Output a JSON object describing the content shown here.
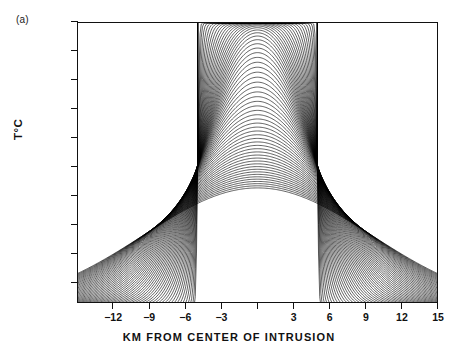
{
  "figure": {
    "panel_letter": "(a)",
    "width": 458,
    "height": 356
  },
  "axes": {
    "x_title": "KM FROM CENTER OF INTRUSION",
    "y_title": "T°C"
  },
  "chart_data": {
    "type": "line",
    "title": "",
    "subtitle": "",
    "xlabel": "KM FROM CENTER OF INTRUSION",
    "ylabel": "T°C",
    "xlim": [
      -15,
      15
    ],
    "ylim": [
      527,
      1375
    ],
    "grid": false,
    "legend": null,
    "annotations": [
      "(a)"
    ],
    "xticks": [
      -12,
      -9,
      -6,
      -3,
      0,
      3,
      6,
      9,
      12,
      15
    ],
    "xticklabels": [
      "-12",
      "-9",
      "-6",
      "-3",
      "",
      "3",
      "6",
      "9",
      "12",
      "15"
    ],
    "yticks": [
      587.5,
      675,
      762.5,
      850,
      937.5,
      1025,
      1112.5,
      1200,
      1287.5,
      1375
    ],
    "yticklabels": [
      "587.5",
      "675",
      "762.5",
      "850",
      "937.5",
      "1025",
      "1112.5",
      "1200",
      "1287.5",
      "1375"
    ],
    "intrusion_half_width_km": 5,
    "n_curves": 62,
    "series_color": "#000000",
    "x_sample": [
      -15,
      -12,
      -9,
      -6,
      -5,
      -3,
      0,
      3,
      5,
      6,
      9,
      12,
      15
    ],
    "series": [
      {
        "name": "t01",
        "values": [
          527,
          527,
          528,
          560,
          1375,
          1375,
          1375,
          1375,
          1375,
          560,
          528,
          527,
          527
        ]
      },
      {
        "name": "t10",
        "values": [
          529,
          535,
          556,
          640,
          1290,
          1330,
          1340,
          1330,
          1290,
          640,
          556,
          535,
          529
        ]
      },
      {
        "name": "t20",
        "values": [
          533,
          549,
          590,
          700,
          1160,
          1230,
          1255,
          1230,
          1160,
          700,
          590,
          549,
          533
        ]
      },
      {
        "name": "t30",
        "values": [
          540,
          566,
          625,
          744,
          1040,
          1120,
          1150,
          1120,
          1040,
          744,
          625,
          566,
          540
        ]
      },
      {
        "name": "t40",
        "values": [
          549,
          585,
          657,
          775,
          950,
          1010,
          1040,
          1010,
          950,
          775,
          657,
          585,
          549
        ]
      },
      {
        "name": "t50",
        "values": [
          558,
          602,
          681,
          793,
          880,
          915,
          935,
          915,
          880,
          793,
          681,
          602,
          558
        ]
      },
      {
        "name": "t62",
        "values": [
          570,
          620,
          700,
          790,
          820,
          840,
          850,
          840,
          820,
          790,
          700,
          620,
          570
        ]
      }
    ]
  }
}
